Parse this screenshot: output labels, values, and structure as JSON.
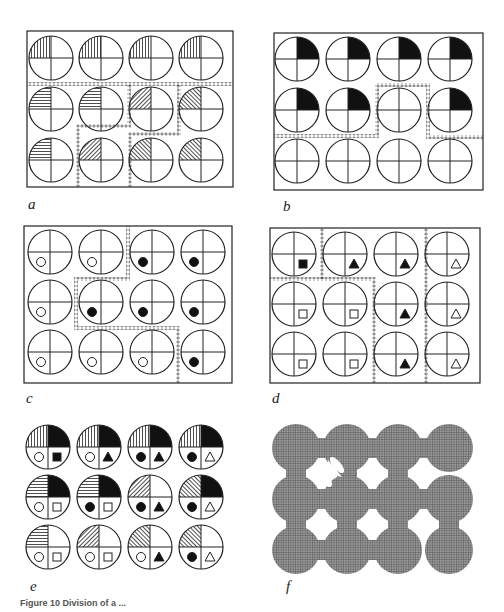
{
  "figure": {
    "caption": "Figure 10   Division of a ...",
    "panels": [
      {
        "id": "a",
        "label": "a"
      },
      {
        "id": "b",
        "label": "b"
      },
      {
        "id": "c",
        "label": "c"
      },
      {
        "id": "d",
        "label": "d"
      },
      {
        "id": "e",
        "label": "e"
      },
      {
        "id": "f",
        "label": "f"
      }
    ],
    "grid": {
      "rows": 3,
      "cols": 4
    },
    "panel_a": {
      "description": "Top-left quadrant hatching per cell",
      "cells": [
        [
          "vertical",
          "vertical",
          "vertical",
          "vertical"
        ],
        [
          "horizontal",
          "horizontal",
          "diag-left",
          "diag-right"
        ],
        [
          "horizontal",
          "diag-left",
          "diag-right",
          "diag-right"
        ]
      ]
    },
    "panel_b": {
      "description": "Top-right quadrant filled black per cell",
      "cells": [
        [
          true,
          true,
          true,
          true
        ],
        [
          true,
          true,
          false,
          true
        ],
        [
          false,
          false,
          false,
          false
        ]
      ]
    },
    "panel_c": {
      "description": "Lower-left quadrant circle marker (open/filled)",
      "cells": [
        [
          "open",
          "open",
          "filled",
          "filled"
        ],
        [
          "open",
          "filled",
          "filled",
          "filled"
        ],
        [
          "open",
          "open",
          "open",
          "filled"
        ]
      ]
    },
    "panel_d": {
      "description": "Lower-right quadrant marker",
      "cells": [
        [
          "square-filled",
          "triangle-filled",
          "triangle-filled",
          "triangle-open"
        ],
        [
          "square-open",
          "square-open",
          "triangle-filled",
          "triangle-open"
        ],
        [
          "square-open",
          "square-open",
          "triangle-filled",
          "triangle-open"
        ]
      ]
    },
    "panel_e": {
      "description": "Superposition of attributes from a–d"
    },
    "panel_f": {
      "description": "Merged regions of cells, cross-hatched gray"
    }
  }
}
